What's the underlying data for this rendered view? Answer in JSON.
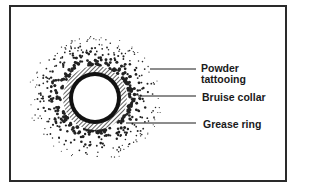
{
  "figure": {
    "type": "wound-diagram"
  },
  "wound": {
    "center": [
      95,
      98
    ],
    "hole_radius": 22,
    "grease_ring": {
      "inner": 22,
      "outer": 26,
      "color": "#111111"
    },
    "bruise_collar": {
      "inner": 26,
      "outer": 32,
      "pattern": "diagonal-hatch"
    },
    "stippling": {
      "inner_radius": 33,
      "outer_radius": 64,
      "approx_dot_count": 520,
      "color": "#222222",
      "max_dot_radius": 1.7,
      "min_dot_radius": 0.5,
      "seed": 7
    }
  },
  "labels": [
    {
      "id": "powder-tattooing",
      "lines": [
        "Powder",
        "tattooing"
      ],
      "text_x": 201,
      "text_y": 64,
      "leader_y": 69,
      "leader_x1": 150,
      "leader_x2": 196
    },
    {
      "id": "bruise-collar",
      "lines": [
        "Bruise collar"
      ],
      "text_x": 202,
      "text_y": 92,
      "leader_y": 96,
      "leader_x1": 138,
      "leader_x2": 196
    },
    {
      "id": "grease-ring",
      "lines": [
        "Grease ring"
      ],
      "text_x": 203,
      "text_y": 120,
      "leader_y": 123,
      "leader_x1": 126,
      "leader_x2": 196
    }
  ],
  "label_text": {
    "powder_tattooing_1": "Powder",
    "powder_tattooing_2": "tattooing",
    "bruise_collar": "Bruise collar",
    "grease_ring": "Grease ring"
  }
}
